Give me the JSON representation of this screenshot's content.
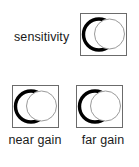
{
  "figure": {
    "type": "control-knob-diagram",
    "background_color": "#ffffff",
    "ink_color": "#1a1a1a",
    "box_border_color": "#6b6b6b",
    "knob_outline_color": "#000000",
    "knob_face_color": "#ffffff",
    "knob_face_border_color": "#9a9a9a"
  },
  "controls": [
    {
      "id": "sensitivity",
      "label": "sensitivity",
      "label_position": "left",
      "icon": "rotary-knob-icon"
    },
    {
      "id": "near-gain",
      "label": "near gain",
      "label_position": "below",
      "icon": "rotary-knob-icon"
    },
    {
      "id": "far-gain",
      "label": "far gain",
      "label_position": "below",
      "icon": "rotary-knob-icon"
    }
  ]
}
